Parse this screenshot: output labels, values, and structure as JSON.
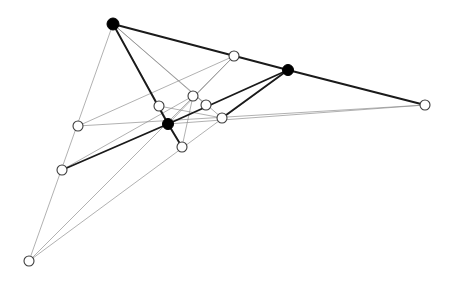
{
  "figure": {
    "width": 454,
    "height": 284,
    "background_color": "#ffffff",
    "colors": {
      "thick_line": "#1a1a1a",
      "thin_line": "#8a8a8a",
      "mid_line": "#5a5a5a",
      "filled_point_fill": "#000000",
      "open_point_fill": "#ffffff",
      "open_point_stroke": "#3c3c3c"
    }
  },
  "chart_data": {
    "type": "scatter",
    "xlabel": "",
    "ylabel": "",
    "xlim": [
      0,
      454
    ],
    "ylim": [
      284,
      0
    ],
    "grid": false,
    "legend": "none",
    "annotations": [],
    "points": [
      {
        "id": "A",
        "label": "A",
        "x": 113,
        "y": 24,
        "style": "filled",
        "radius": 6.0
      },
      {
        "id": "B",
        "label": "B",
        "x": 288,
        "y": 70,
        "style": "filled",
        "radius": 5.5
      },
      {
        "id": "C",
        "label": "C",
        "x": 168,
        "y": 124,
        "style": "filled",
        "radius": 5.5
      },
      {
        "id": "D",
        "label": "D",
        "x": 234,
        "y": 56,
        "style": "open",
        "radius": 5.0
      },
      {
        "id": "E",
        "label": "E",
        "x": 193,
        "y": 96,
        "style": "open",
        "radius": 5.0
      },
      {
        "id": "F",
        "label": "F",
        "x": 159,
        "y": 106,
        "style": "open",
        "radius": 5.0
      },
      {
        "id": "G",
        "label": "G",
        "x": 206,
        "y": 105,
        "style": "open",
        "radius": 5.0
      },
      {
        "id": "H",
        "label": "H",
        "x": 222,
        "y": 118,
        "style": "open",
        "radius": 5.0
      },
      {
        "id": "I",
        "label": "I",
        "x": 182,
        "y": 147,
        "style": "open",
        "radius": 5.0
      },
      {
        "id": "J",
        "label": "J",
        "x": 425,
        "y": 105,
        "style": "open",
        "radius": 5.0
      },
      {
        "id": "K",
        "label": "K",
        "x": 78,
        "y": 126,
        "style": "open",
        "radius": 5.0
      },
      {
        "id": "L",
        "label": "L",
        "x": 62,
        "y": 170,
        "style": "open",
        "radius": 5.0
      },
      {
        "id": "M",
        "label": "M",
        "x": 29,
        "y": 261,
        "style": "open",
        "radius": 5.0
      }
    ],
    "segments": [
      {
        "id": "s1",
        "from": "A",
        "to": "B",
        "weight": "thick"
      },
      {
        "id": "s2",
        "from": "A",
        "to": "C",
        "weight": "thick"
      },
      {
        "id": "s3",
        "from": "B",
        "to": "C",
        "weight": "thick"
      },
      {
        "id": "s4",
        "from": "B",
        "to": "J",
        "weight": "thick"
      },
      {
        "id": "s5",
        "from": "C",
        "to": "L",
        "weight": "thick"
      },
      {
        "id": "s6",
        "from": "C",
        "to": "I",
        "weight": "thick"
      },
      {
        "id": "s7",
        "from": "B",
        "to": "H",
        "weight": "thick"
      },
      {
        "id": "s8",
        "from": "A",
        "to": "M",
        "weight": "thin"
      },
      {
        "id": "s9",
        "from": "A",
        "to": "I",
        "weight": "thin"
      },
      {
        "id": "s10",
        "from": "A",
        "to": "H",
        "weight": "thin"
      },
      {
        "id": "s11",
        "from": "A",
        "to": "G",
        "weight": "thin"
      },
      {
        "id": "s12",
        "from": "M",
        "to": "B",
        "weight": "thin"
      },
      {
        "id": "s13",
        "from": "M",
        "to": "D",
        "weight": "thin"
      },
      {
        "id": "s14",
        "from": "K",
        "to": "J",
        "weight": "thin"
      },
      {
        "id": "s15",
        "from": "K",
        "to": "D",
        "weight": "thin"
      },
      {
        "id": "s16",
        "from": "L",
        "to": "E",
        "weight": "thin"
      },
      {
        "id": "s17",
        "from": "C",
        "to": "J",
        "weight": "thin"
      },
      {
        "id": "s18",
        "from": "C",
        "to": "D",
        "weight": "thin"
      },
      {
        "id": "s19",
        "from": "F",
        "to": "H",
        "weight": "thin"
      },
      {
        "id": "s20",
        "from": "E",
        "to": "I",
        "weight": "thin"
      }
    ]
  }
}
